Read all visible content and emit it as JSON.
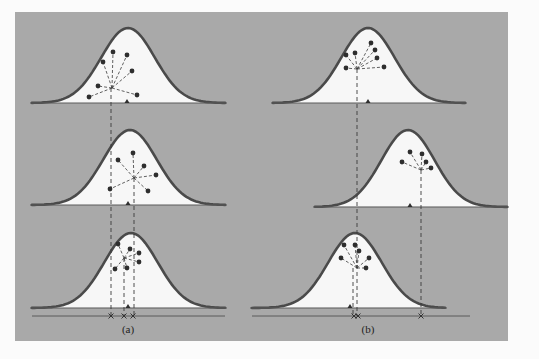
{
  "colors": {
    "page_background": "#fbfbfb",
    "panel_background": "#a9a9a9",
    "curve_fill": "#f7f7f7",
    "curve_stroke": "#4a4a4a",
    "baseline_stroke": "#5a5a5a",
    "point_fill": "#2e2e2e",
    "dash_stroke": "#3a3a3a"
  },
  "panel": {
    "x": 15,
    "y": 12,
    "width": 493,
    "height": 329
  },
  "labels": {
    "a": "(a)",
    "b": "(b)"
  },
  "columns": [
    {
      "id": "a",
      "label": "(a)",
      "label_pos": [
        128,
        333
      ],
      "axis": {
        "y": 316,
        "x1": 32,
        "x2": 225
      },
      "markers": [
        111,
        124,
        133
      ],
      "curves": [
        {
          "x1": 32,
          "x2": 225,
          "peak_x": 128,
          "peak_y": 28,
          "base_y": 103,
          "triangle_x": 127,
          "center": [
            112,
            88
          ],
          "points": [
            [
              113,
              52
            ],
            [
              127,
              55
            ],
            [
              103,
              62
            ],
            [
              132,
              71
            ],
            [
              98,
              86
            ],
            [
              89,
              97
            ],
            [
              137,
              95
            ]
          ],
          "drop_x": 111
        },
        {
          "x1": 32,
          "x2": 225,
          "peak_x": 130,
          "peak_y": 130,
          "base_y": 205,
          "triangle_x": 128,
          "center": [
            134,
            178
          ],
          "points": [
            [
              118,
              160
            ],
            [
              133,
              153
            ],
            [
              144,
              166
            ],
            [
              156,
              175
            ],
            [
              110,
              189
            ],
            [
              148,
              191
            ]
          ],
          "drop_x": 134
        },
        {
          "x1": 32,
          "x2": 225,
          "peak_x": 131,
          "peak_y": 233,
          "base_y": 308,
          "triangle_x": 128,
          "center": [
            124,
            258
          ],
          "points": [
            [
              118,
              244
            ],
            [
              130,
              249
            ],
            [
              139,
              253
            ],
            [
              139,
              262
            ],
            [
              115,
              269
            ],
            [
              127,
              268
            ]
          ],
          "drop_x": 124
        }
      ]
    },
    {
      "id": "b",
      "label": "(b)",
      "label_pos": [
        368,
        333
      ],
      "axis": {
        "y": 316,
        "x1": 252,
        "x2": 470
      },
      "markers": [
        354,
        358,
        421
      ],
      "curves": [
        {
          "x1": 273,
          "x2": 465,
          "peak_x": 368,
          "peak_y": 28,
          "base_y": 103,
          "triangle_x": 368,
          "center": [
            357,
            69
          ],
          "points": [
            [
              371,
              43
            ],
            [
              375,
              50
            ],
            [
              377,
              58
            ],
            [
              346,
              55
            ],
            [
              355,
              53
            ],
            [
              346,
              68
            ],
            [
              384,
              67
            ]
          ],
          "drop_x": 357
        },
        {
          "x1": 315,
          "x2": 507,
          "peak_x": 408,
          "peak_y": 130,
          "base_y": 207,
          "triangle_x": 410,
          "center": [
            421,
            170
          ],
          "points": [
            [
              410,
              152
            ],
            [
              422,
              154
            ],
            [
              426,
              162
            ],
            [
              402,
              162
            ],
            [
              431,
              168
            ]
          ],
          "drop_x": 421
        },
        {
          "x1": 252,
          "x2": 445,
          "peak_x": 355,
          "peak_y": 233,
          "base_y": 308,
          "triangle_x": 350,
          "center": [
            357,
            268
          ],
          "points": [
            [
              344,
              245
            ],
            [
              355,
              245
            ],
            [
              359,
              251
            ],
            [
              341,
              258
            ],
            [
              369,
              258
            ],
            [
              366,
              268
            ]
          ],
          "drop_x": 353
        }
      ]
    }
  ]
}
